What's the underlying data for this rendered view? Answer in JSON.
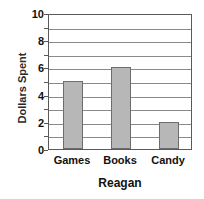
{
  "chart_data": {
    "type": "bar",
    "title": "",
    "xlabel": "Reagan",
    "ylabel": "Dollars Spent",
    "categories": [
      "Games",
      "Books",
      "Candy"
    ],
    "values": [
      5,
      6,
      2
    ],
    "ylim": [
      0,
      10
    ],
    "ytick_labels": [
      "0",
      "2",
      "4",
      "6",
      "8",
      "10"
    ],
    "ytick_values": [
      0,
      2,
      4,
      6,
      8,
      10
    ],
    "grid": true,
    "grid_step": 1,
    "legend": "none",
    "bar_fill_color": "#b7b7b7",
    "bar_edge_color": "#6d6d6d",
    "grid_color": "#8a8a8a",
    "axis_color": "#5a5a5a",
    "background_color": "#ffffff"
  }
}
